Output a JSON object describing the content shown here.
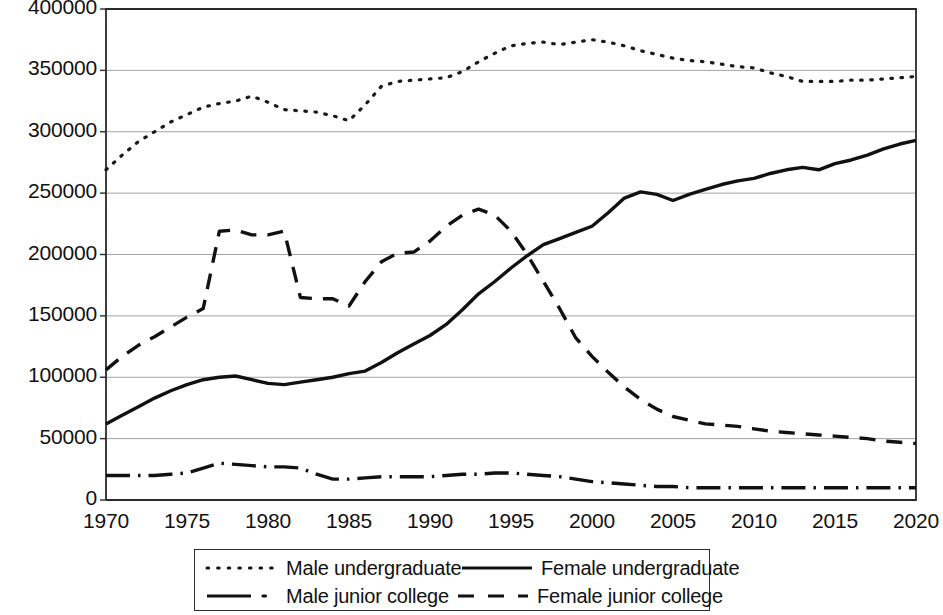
{
  "chart_data": {
    "type": "line",
    "title": "",
    "xlabel": "",
    "ylabel": "",
    "xlim": [
      1970,
      2020
    ],
    "ylim": [
      0,
      400000
    ],
    "grid": true,
    "legend_position": "bottom",
    "x_ticks": [
      "1970",
      "1975",
      "1980",
      "1985",
      "1990",
      "1995",
      "2000",
      "2005",
      "2010",
      "2015",
      "2020"
    ],
    "y_ticks": [
      "0",
      "50000",
      "100000",
      "150000",
      "200000",
      "250000",
      "300000",
      "350000",
      "400000"
    ],
    "x": [
      1970,
      1971,
      1972,
      1973,
      1974,
      1975,
      1976,
      1977,
      1978,
      1979,
      1980,
      1981,
      1982,
      1983,
      1984,
      1985,
      1986,
      1987,
      1988,
      1989,
      1990,
      1991,
      1992,
      1993,
      1994,
      1995,
      1996,
      1997,
      1998,
      1999,
      2000,
      2001,
      2002,
      2003,
      2004,
      2005,
      2006,
      2007,
      2008,
      2009,
      2010,
      2011,
      2012,
      2013,
      2014,
      2015,
      2016,
      2017,
      2018,
      2019,
      2020
    ],
    "series": [
      {
        "name": "Male undergraduate",
        "style": "dotted",
        "color": "#1a1a1a",
        "values": [
          269000,
          281000,
          292000,
          300000,
          308000,
          314000,
          320000,
          323000,
          325000,
          329000,
          324000,
          318000,
          317000,
          316000,
          313000,
          309000,
          322000,
          337000,
          341000,
          342000,
          343000,
          344000,
          349000,
          357000,
          364000,
          370000,
          372000,
          373000,
          371000,
          373000,
          375000,
          373000,
          370000,
          366000,
          363000,
          360000,
          358000,
          357000,
          355000,
          353000,
          352000,
          348000,
          345000,
          341000,
          341000,
          341000,
          342000,
          342000,
          343000,
          344000,
          345000
        ]
      },
      {
        "name": "Female undergraduate",
        "style": "solid",
        "color": "#111111",
        "values": [
          62000,
          69000,
          76000,
          83000,
          89000,
          94000,
          98000,
          100000,
          101000,
          98000,
          95000,
          94000,
          96000,
          98000,
          100000,
          103000,
          105000,
          112000,
          120000,
          127000,
          134000,
          143000,
          155000,
          168000,
          178000,
          189000,
          199000,
          208000,
          213000,
          218000,
          223000,
          234000,
          246000,
          251000,
          249000,
          244000,
          249000,
          253000,
          257000,
          260000,
          262000,
          266000,
          269000,
          271000,
          269000,
          274000,
          277000,
          281000,
          286000,
          290000,
          293000
        ]
      },
      {
        "name": "Male junior college",
        "style": "dashdot",
        "color": "#111111",
        "values": [
          20000,
          20000,
          20000,
          20000,
          21000,
          22000,
          26000,
          30000,
          29000,
          28000,
          27000,
          27000,
          26000,
          21000,
          17000,
          17000,
          18000,
          19000,
          19000,
          19000,
          19000,
          20000,
          21000,
          21000,
          22000,
          22000,
          21000,
          20000,
          19000,
          17000,
          15000,
          14000,
          13000,
          12000,
          11000,
          11000,
          10000,
          10000,
          10000,
          10000,
          10000,
          10000,
          10000,
          10000,
          10000,
          10000,
          10000,
          10000,
          10000,
          10000,
          10000
        ]
      },
      {
        "name": "Female junior college",
        "style": "dashed",
        "color": "#111111",
        "values": [
          106000,
          117000,
          126000,
          133000,
          141000,
          149000,
          156000,
          219000,
          220000,
          216000,
          216000,
          219000,
          165000,
          164000,
          164000,
          158000,
          178000,
          194000,
          201000,
          202000,
          211000,
          223000,
          232000,
          237000,
          232000,
          219000,
          200000,
          178000,
          156000,
          132000,
          117000,
          104000,
          92000,
          82000,
          74000,
          68000,
          65000,
          62000,
          61000,
          60000,
          58000,
          56000,
          55000,
          54000,
          53000,
          52000,
          51000,
          50000,
          48000,
          47000,
          46000
        ]
      }
    ],
    "legend": [
      {
        "label": "Male undergraduate",
        "style": "dotted"
      },
      {
        "label": "Female undergraduate",
        "style": "solid"
      },
      {
        "label": "Male junior college",
        "style": "dashdot"
      },
      {
        "label": "Female junior college",
        "style": "dashed"
      }
    ]
  }
}
